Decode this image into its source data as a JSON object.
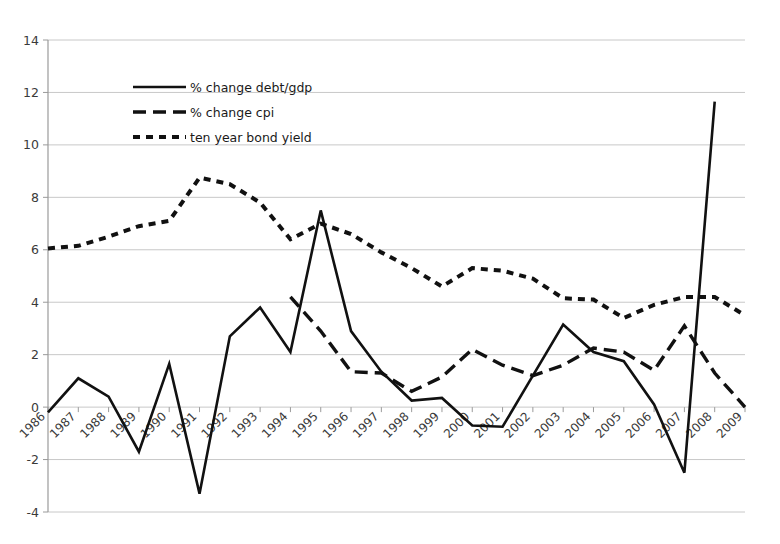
{
  "chart_data": {
    "type": "line",
    "title": "",
    "xlabel": "",
    "ylabel": "",
    "ylim": [
      -4,
      14
    ],
    "ytick_step": 2,
    "yticks": [
      "14",
      "12",
      "10",
      "8",
      "6",
      "4",
      "2",
      "0",
      "-2",
      "-4"
    ],
    "grid": true,
    "legend_position": "upper-left-inside",
    "categories": [
      "1986",
      "1987",
      "1988",
      "1989",
      "1990",
      "1991",
      "1992",
      "1993",
      "1994",
      "1995",
      "1996",
      "1997",
      "1998",
      "1999",
      "2000",
      "2001",
      "2002",
      "2003",
      "2004",
      "2005",
      "2006",
      "2007",
      "2008",
      "2009"
    ],
    "series": [
      {
        "name": "% change debt/gdp",
        "style": "solid",
        "color": "#111111",
        "values": [
          -0.2,
          1.1,
          0.4,
          -1.7,
          1.65,
          -3.3,
          2.7,
          3.8,
          2.1,
          7.5,
          2.9,
          1.35,
          0.25,
          0.35,
          -0.7,
          -0.75,
          1.2,
          3.15,
          2.1,
          1.75,
          0.1,
          -2.5,
          11.65,
          null
        ]
      },
      {
        "name": "% change cpi",
        "style": "long-dash",
        "color": "#111111",
        "values": [
          null,
          null,
          null,
          null,
          null,
          null,
          null,
          null,
          4.2,
          2.9,
          1.35,
          1.3,
          0.6,
          1.15,
          2.2,
          1.6,
          1.2,
          1.6,
          2.25,
          2.1,
          1.4,
          3.1,
          1.3,
          0.0
        ]
      },
      {
        "name": "ten year bond yield",
        "style": "dotted",
        "color": "#111111",
        "values": [
          6.05,
          6.15,
          6.5,
          6.9,
          7.1,
          8.75,
          8.5,
          7.8,
          6.4,
          7.0,
          6.6,
          5.9,
          5.3,
          4.6,
          5.3,
          5.2,
          4.9,
          4.15,
          4.1,
          3.4,
          3.9,
          4.2,
          4.2,
          3.5
        ]
      }
    ]
  },
  "legend": {
    "items": [
      {
        "label": "% change debt/gdp",
        "style": "solid"
      },
      {
        "label": "% change cpi",
        "style": "long-dash"
      },
      {
        "label": "ten year bond yield",
        "style": "dotted"
      }
    ]
  }
}
